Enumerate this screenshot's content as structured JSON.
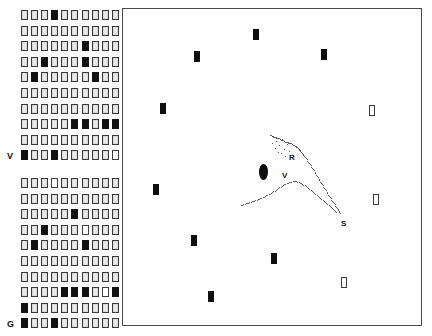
{
  "figure": {
    "title": "",
    "background_color": "#ffffff",
    "frame_color": "#4a4a4a",
    "marker_fill_color": "#0e0e0e",
    "marker_open_color": "#ffffff"
  },
  "matrix": {
    "cell_states_legend": {
      "0": "open",
      "1": "filled",
      "2": "blank"
    },
    "columns": 10,
    "top_block": {
      "label_bottom": "V",
      "rows": [
        {
          "label": "",
          "cells": [
            0,
            0,
            0,
            1,
            0,
            0,
            0,
            0,
            0,
            0
          ]
        },
        {
          "label": "",
          "cells": [
            0,
            0,
            0,
            0,
            0,
            0,
            0,
            0,
            0,
            0
          ]
        },
        {
          "label": "",
          "cells": [
            0,
            0,
            0,
            0,
            0,
            0,
            1,
            0,
            0,
            0
          ]
        },
        {
          "label": "",
          "cells": [
            0,
            0,
            1,
            0,
            0,
            0,
            1,
            0,
            0,
            0
          ]
        },
        {
          "label": "",
          "cells": [
            0,
            1,
            0,
            0,
            0,
            0,
            0,
            1,
            0,
            0
          ]
        },
        {
          "label": "",
          "cells": [
            0,
            0,
            0,
            0,
            0,
            0,
            0,
            0,
            0,
            0
          ]
        },
        {
          "label": "",
          "cells": [
            0,
            0,
            0,
            0,
            0,
            0,
            0,
            0,
            0,
            0
          ]
        },
        {
          "label": "",
          "cells": [
            0,
            0,
            0,
            0,
            0,
            1,
            1,
            0,
            1,
            1
          ]
        },
        {
          "label": "",
          "cells": [
            0,
            0,
            0,
            0,
            0,
            0,
            0,
            0,
            0,
            0
          ]
        },
        {
          "label": "V",
          "cells": [
            1,
            0,
            0,
            1,
            0,
            0,
            0,
            0,
            0,
            2
          ]
        }
      ]
    },
    "bottom_block": {
      "label_bottom": "G",
      "rows": [
        {
          "label": "",
          "cells": [
            0,
            0,
            0,
            2,
            0,
            0,
            0,
            0,
            0,
            0
          ]
        },
        {
          "label": "",
          "cells": [
            0,
            0,
            0,
            0,
            0,
            0,
            0,
            0,
            0,
            0
          ]
        },
        {
          "label": "",
          "cells": [
            0,
            0,
            0,
            0,
            0,
            1,
            0,
            0,
            0,
            0
          ]
        },
        {
          "label": "",
          "cells": [
            0,
            0,
            1,
            0,
            0,
            0,
            2,
            0,
            0,
            0
          ]
        },
        {
          "label": "",
          "cells": [
            0,
            1,
            0,
            0,
            0,
            0,
            1,
            0,
            0,
            0
          ]
        },
        {
          "label": "",
          "cells": [
            0,
            0,
            0,
            0,
            0,
            0,
            0,
            0,
            0,
            0
          ]
        },
        {
          "label": "",
          "cells": [
            0,
            0,
            0,
            0,
            0,
            0,
            0,
            0,
            0,
            0
          ]
        },
        {
          "label": "",
          "cells": [
            0,
            0,
            0,
            0,
            1,
            1,
            1,
            0,
            2,
            1
          ]
        },
        {
          "label": "",
          "cells": [
            1,
            0,
            0,
            0,
            0,
            0,
            0,
            0,
            0,
            0
          ]
        },
        {
          "label": "G",
          "cells": [
            1,
            0,
            0,
            1,
            0,
            0,
            0,
            0,
            0,
            0
          ]
        }
      ]
    }
  },
  "chart_data": {
    "type": "scatter",
    "title": "",
    "xlabel": "",
    "ylabel": "",
    "grid": false,
    "legend": "none",
    "xlim": [
      0,
      300
    ],
    "ylim": [
      0,
      318
    ],
    "series": [
      {
        "name": "filled-markers",
        "style": "filled-rectangle",
        "points": [
          {
            "x": 130,
            "y": 20
          },
          {
            "x": 71,
            "y": 42
          },
          {
            "x": 198,
            "y": 40
          },
          {
            "x": 37,
            "y": 94
          },
          {
            "x": 30,
            "y": 175
          },
          {
            "x": 68,
            "y": 226
          },
          {
            "x": 148,
            "y": 244
          },
          {
            "x": 85,
            "y": 282
          }
        ]
      },
      {
        "name": "open-markers",
        "style": "open-rectangle",
        "points": [
          {
            "x": 246,
            "y": 96
          },
          {
            "x": 250,
            "y": 185
          },
          {
            "x": 218,
            "y": 268
          }
        ]
      },
      {
        "name": "dense-blob",
        "style": "filled-ellipse",
        "points": [
          {
            "x": 136,
            "y": 155,
            "w": 9,
            "h": 16
          }
        ]
      },
      {
        "name": "dotted-trace-upper",
        "style": "dotted-curve",
        "points": [
          {
            "x": 147,
            "y": 126
          },
          {
            "x": 151,
            "y": 128
          },
          {
            "x": 155,
            "y": 129
          },
          {
            "x": 159,
            "y": 131
          },
          {
            "x": 163,
            "y": 133
          },
          {
            "x": 167,
            "y": 134
          },
          {
            "x": 171,
            "y": 136
          },
          {
            "x": 175,
            "y": 139
          },
          {
            "x": 178,
            "y": 143
          },
          {
            "x": 182,
            "y": 148
          },
          {
            "x": 186,
            "y": 154
          },
          {
            "x": 190,
            "y": 160
          },
          {
            "x": 194,
            "y": 167
          },
          {
            "x": 198,
            "y": 174
          },
          {
            "x": 202,
            "y": 180
          },
          {
            "x": 206,
            "y": 187
          },
          {
            "x": 210,
            "y": 193
          },
          {
            "x": 214,
            "y": 199
          },
          {
            "x": 217,
            "y": 204
          }
        ]
      },
      {
        "name": "dotted-trace-lower",
        "style": "dotted-curve",
        "points": [
          {
            "x": 118,
            "y": 196
          },
          {
            "x": 124,
            "y": 194
          },
          {
            "x": 130,
            "y": 192
          },
          {
            "x": 136,
            "y": 190
          },
          {
            "x": 142,
            "y": 187
          },
          {
            "x": 148,
            "y": 184
          },
          {
            "x": 154,
            "y": 180
          },
          {
            "x": 160,
            "y": 176
          },
          {
            "x": 166,
            "y": 173
          },
          {
            "x": 172,
            "y": 172
          },
          {
            "x": 178,
            "y": 174
          },
          {
            "x": 184,
            "y": 178
          },
          {
            "x": 190,
            "y": 183
          },
          {
            "x": 196,
            "y": 188
          },
          {
            "x": 202,
            "y": 193
          },
          {
            "x": 208,
            "y": 198
          },
          {
            "x": 213,
            "y": 203
          }
        ]
      },
      {
        "name": "dotted-cluster",
        "style": "dotted-cloud",
        "points": [
          {
            "x": 150,
            "y": 127
          },
          {
            "x": 153,
            "y": 132
          },
          {
            "x": 156,
            "y": 136
          },
          {
            "x": 159,
            "y": 130
          },
          {
            "x": 161,
            "y": 140
          },
          {
            "x": 164,
            "y": 135
          },
          {
            "x": 166,
            "y": 142
          },
          {
            "x": 152,
            "y": 139
          },
          {
            "x": 158,
            "y": 144
          },
          {
            "x": 162,
            "y": 147
          },
          {
            "x": 155,
            "y": 143
          },
          {
            "x": 149,
            "y": 134
          }
        ]
      }
    ],
    "annotations": [
      {
        "text": "R",
        "x": 166,
        "y": 144
      },
      {
        "text": "V",
        "x": 159,
        "y": 162
      },
      {
        "text": "S",
        "x": 218,
        "y": 210
      }
    ]
  }
}
